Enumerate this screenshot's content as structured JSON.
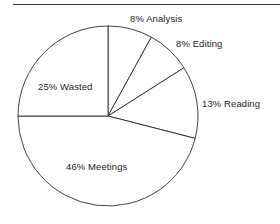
{
  "figure": {
    "background_color": "#ffffff",
    "outline_color": "#2b2b2b",
    "text_color": "#1d1d1d",
    "rule_color": "#3a3a3a"
  },
  "labels": {
    "analysis": "8% Analysis",
    "editing": "8% Editing",
    "reading": "13% Reading",
    "wasted": "25% Wasted",
    "meetings": "46% Meetings"
  },
  "chart_data": {
    "type": "pie",
    "title": "",
    "subtitle": "",
    "xlabel": "",
    "ylabel": "",
    "grid": false,
    "legend_position": "none",
    "label_style": "outside-and-inside",
    "start_angle_deg": 90,
    "direction": "clockwise",
    "center_px": [
      108,
      116
    ],
    "radius_px": 90,
    "categories": [
      "Analysis",
      "Editing",
      "Reading",
      "Meetings",
      "Wasted"
    ],
    "values": [
      8,
      8,
      13,
      46,
      25
    ],
    "value_unit": "%",
    "slice_colors": [
      "#ffffff",
      "#ffffff",
      "#ffffff",
      "#ffffff",
      "#ffffff"
    ],
    "slices": [
      {
        "label": "Analysis",
        "value": 8,
        "text": "8% Analysis",
        "start_deg": 0.0,
        "end_deg": 28.8
      },
      {
        "label": "Editing",
        "value": 8,
        "text": "8% Editing",
        "start_deg": 28.8,
        "end_deg": 57.6
      },
      {
        "label": "Reading",
        "value": 13,
        "text": "13% Reading",
        "start_deg": 57.6,
        "end_deg": 104.4
      },
      {
        "label": "Meetings",
        "value": 46,
        "text": "46% Meetings",
        "start_deg": 104.4,
        "end_deg": 270.0
      },
      {
        "label": "Wasted",
        "value": 25,
        "text": "25% Wasted",
        "start_deg": 270.0,
        "end_deg": 360.0
      }
    ],
    "total": 100
  }
}
